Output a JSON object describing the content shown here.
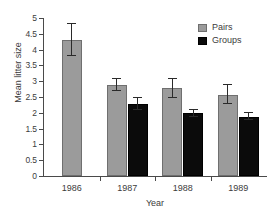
{
  "chart_data": {
    "type": "bar",
    "title": "",
    "xlabel": "Year",
    "ylabel": "Mean litter size",
    "categories": [
      "1986",
      "1987",
      "1988",
      "1989"
    ],
    "ylim": [
      0,
      5
    ],
    "yticks": [
      "0",
      "0.5",
      "1",
      "1.5",
      "2",
      "2.5",
      "3",
      "3.5",
      "4",
      "4.5",
      "5"
    ],
    "ytick_values": [
      0,
      0.5,
      1,
      1.5,
      2,
      2.5,
      3,
      3.5,
      4,
      4.5,
      5
    ],
    "grid": false,
    "legend_position": "top-right",
    "error_bars": "symmetric",
    "series": [
      {
        "name": "Pairs",
        "color": "#9b9b9b",
        "values": [
          4.3,
          2.88,
          2.78,
          2.57
        ],
        "errors": [
          0.5,
          0.2,
          0.3,
          0.3
        ]
      },
      {
        "name": "Groups",
        "color": "#0b0b0b",
        "values": [
          null,
          2.28,
          1.98,
          1.88
        ],
        "errors": [
          null,
          0.18,
          0.1,
          0.1
        ]
      }
    ]
  },
  "legend": {
    "items": [
      {
        "label": "Pairs",
        "color": "#9b9b9b"
      },
      {
        "label": "Groups",
        "color": "#0b0b0b"
      }
    ]
  },
  "axes": {
    "y_title": "Mean litter size",
    "x_title": "Year",
    "y_ticks": [
      "5",
      "4.5",
      "4",
      "3.5",
      "3",
      "2.5",
      "2",
      "1.5",
      "1",
      "0.5",
      "0"
    ],
    "x_ticks": [
      "1986",
      "1987",
      "1988",
      "1989"
    ]
  }
}
